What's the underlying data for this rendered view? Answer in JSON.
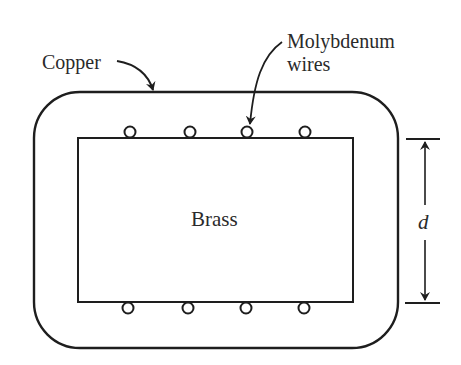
{
  "diagram": {
    "labels": {
      "copper": "Copper",
      "molybdenum_line1": "Molybdenum",
      "molybdenum_line2": "wires",
      "brass": "Brass",
      "dimension": "d"
    },
    "colors": {
      "stroke": "#1e1e1e",
      "text": "#2a2a2a",
      "background": "#ffffff"
    },
    "wires": {
      "top_count": 4,
      "bottom_count": 4
    }
  }
}
